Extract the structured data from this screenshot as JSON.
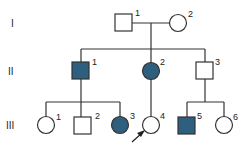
{
  "generations": [
    "I",
    "II",
    "III"
  ],
  "colors": {
    "affected": "#2e5f7e",
    "unaffected": "#ffffff",
    "line": "#333333"
  },
  "individuals": {
    "I1": {
      "label": "1",
      "sex": "male",
      "affected": false
    },
    "I2": {
      "label": "2",
      "sex": "female",
      "affected": false
    },
    "II1": {
      "label": "1",
      "sex": "male",
      "affected": true
    },
    "II2": {
      "label": "2",
      "sex": "female",
      "affected": true
    },
    "II3": {
      "label": "3",
      "sex": "male",
      "affected": false
    },
    "III1": {
      "label": "1",
      "sex": "female",
      "affected": false
    },
    "III2": {
      "label": "2",
      "sex": "male",
      "affected": false
    },
    "III3": {
      "label": "3",
      "sex": "female",
      "affected": true
    },
    "III4": {
      "label": "4",
      "sex": "female",
      "affected": false,
      "proband": true
    },
    "III5": {
      "label": "5",
      "sex": "male",
      "affected": true
    },
    "III6": {
      "label": "6",
      "sex": "female",
      "affected": false
    }
  }
}
